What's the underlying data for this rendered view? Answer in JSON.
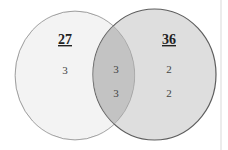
{
  "diagram": {
    "type": "venn",
    "colors": {
      "background": "#ffffff",
      "left_fill": "#f2f2f2",
      "left_stroke": "#b0b0b0",
      "right_fill": "#cfcfcf",
      "right_stroke": "#606060",
      "overlap_fill": "#c2c2c2"
    },
    "sets": [
      {
        "name": "left",
        "total": "27",
        "only_values": [
          "3"
        ]
      },
      {
        "name": "right",
        "total": "36",
        "only_values": [
          "2",
          "2"
        ]
      }
    ],
    "intersection_values": [
      "3",
      "3"
    ]
  }
}
